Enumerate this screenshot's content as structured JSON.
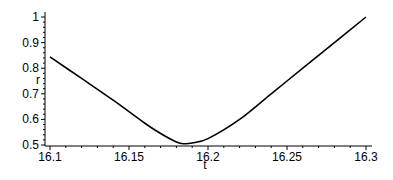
{
  "chart_data": {
    "type": "line",
    "title": "",
    "xlabel": "t",
    "ylabel": "r",
    "xlim": [
      16.1,
      16.3
    ],
    "ylim": [
      0.5,
      1.02
    ],
    "grid": false,
    "x_ticks": [
      "16.1",
      "16.15",
      "16.2",
      "16.25",
      "16.3"
    ],
    "y_ticks": [
      "0.5",
      "0.6",
      "0.7",
      "0.8",
      "0.9",
      "1"
    ],
    "series": [
      {
        "name": "r(t)",
        "color": "#000000",
        "x": [
          16.1,
          16.12,
          16.14,
          16.16,
          16.17,
          16.18,
          16.185,
          16.19,
          16.2,
          16.22,
          16.24,
          16.26,
          16.28,
          16.3
        ],
        "values": [
          0.844,
          0.76,
          0.675,
          0.585,
          0.545,
          0.512,
          0.505,
          0.508,
          0.525,
          0.6,
          0.7,
          0.8,
          0.9,
          1.0
        ]
      }
    ]
  }
}
